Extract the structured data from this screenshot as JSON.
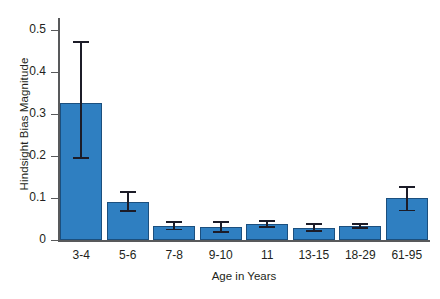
{
  "chart_data": {
    "type": "bar",
    "title": "",
    "xlabel": "Age in Years",
    "ylabel": "Hindsight Bias Magnitude",
    "categories": [
      "3-4",
      "5-6",
      "7-8",
      "9-10",
      "11",
      "13-15",
      "18-29",
      "61-95"
    ],
    "values": [
      0.327,
      0.092,
      0.035,
      0.031,
      0.038,
      0.029,
      0.035,
      0.1
    ],
    "error_low": [
      0.195,
      0.068,
      0.024,
      0.018,
      0.029,
      0.02,
      0.028,
      0.069
    ],
    "error_high": [
      0.475,
      0.118,
      0.047,
      0.046,
      0.048,
      0.042,
      0.042,
      0.13
    ],
    "ylim": [
      0,
      0.53
    ],
    "yticks": [
      0,
      0.1,
      0.2,
      0.3,
      0.4,
      0.5
    ],
    "ytick_labels": [
      "0",
      "0.1",
      "0.2",
      "0.3",
      "0.4",
      "0.5"
    ],
    "grid": false,
    "legend": false,
    "legend_position": "none",
    "bar_color": "#2f7fc1",
    "bar_edge_color": "#1b4f7e",
    "error_color": "#1c1c28",
    "axis_color": "#58595b",
    "background_color": "#ffffff"
  }
}
